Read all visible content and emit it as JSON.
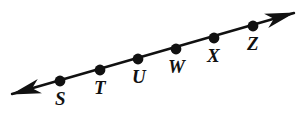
{
  "figure": {
    "kind": "geometry-number-line-diagram",
    "background_color": "#ffffff",
    "stroke_color": "#111111",
    "line": {
      "start_x": 12,
      "start_y": 94,
      "end_x": 294,
      "end_y": 13,
      "stroke_width": 2.4,
      "double_arrow": true
    },
    "arrows": {
      "left_arrow_name": "left-arrowhead",
      "right_arrow_name": "right-arrowhead"
    },
    "points": [
      {
        "label": "S",
        "dot_x": 60,
        "dot_y": 81,
        "label_x": 55,
        "label_y": 89,
        "radius": 5.4
      },
      {
        "label": "T",
        "dot_x": 100,
        "dot_y": 70,
        "label_x": 94,
        "label_y": 78,
        "radius": 5.4
      },
      {
        "label": "U",
        "dot_x": 138,
        "dot_y": 59,
        "label_x": 132,
        "label_y": 67,
        "radius": 5.4
      },
      {
        "label": "W",
        "dot_x": 176,
        "dot_y": 49,
        "label_x": 168,
        "label_y": 57,
        "radius": 5.4
      },
      {
        "label": "X",
        "dot_x": 214,
        "dot_y": 38,
        "label_x": 207,
        "label_y": 46,
        "radius": 5.4
      },
      {
        "label": "Z",
        "dot_x": 253,
        "dot_y": 26,
        "label_x": 247,
        "label_y": 34,
        "radius": 5.4
      }
    ]
  }
}
